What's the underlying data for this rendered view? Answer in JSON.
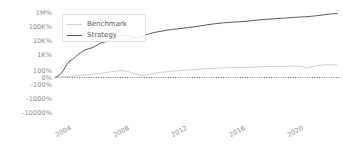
{
  "chart_data": {
    "type": "line",
    "title": "",
    "xlabel": "",
    "ylabel": "",
    "yscale": "symlog-percent",
    "grid": false,
    "legend_position": "upper-left",
    "y_ticks": [
      "1M%",
      "100K%",
      "10K%",
      "1K%",
      "100%",
      "0%",
      "-100%",
      "-1000%",
      "-10000%"
    ],
    "y_tick_values": [
      1000000,
      100000,
      10000,
      1000,
      100,
      0,
      -100,
      -1000,
      -10000
    ],
    "x_ticks": [
      "2004",
      "2008",
      "2012",
      "2016",
      "2020"
    ],
    "x_tick_values": [
      2004,
      2008,
      2012,
      2016,
      2020
    ],
    "xlim": [
      2003.0,
      2022.6
    ],
    "zero_line": "0%",
    "series": [
      {
        "name": "Benchmark",
        "color": "#cfcfcf",
        "x": [
          2003.0,
          2003.3,
          2003.6,
          2004.0,
          2004.4,
          2004.8,
          2005.2,
          2005.6,
          2006.0,
          2006.4,
          2006.8,
          2007.2,
          2007.6,
          2007.9,
          2008.2,
          2008.6,
          2008.9,
          2009.2,
          2009.6,
          2010.0,
          2010.5,
          2011.0,
          2011.5,
          2012.0,
          2012.5,
          2013.0,
          2013.5,
          2014.0,
          2014.5,
          2015.0,
          2015.5,
          2016.0,
          2016.5,
          2017.0,
          2017.5,
          2018.0,
          2018.5,
          2019.0,
          2019.5,
          2020.0,
          2020.3,
          2020.6,
          2021.0,
          2021.5,
          2022.0,
          2022.4
        ],
        "values": [
          0,
          4,
          10,
          18,
          25,
          33,
          42,
          52,
          63,
          74,
          86,
          98,
          106,
          98,
          80,
          52,
          30,
          36,
          55,
          72,
          84,
          96,
          104,
          112,
          120,
          132,
          142,
          150,
          156,
          160,
          162,
          166,
          172,
          180,
          188,
          194,
          190,
          196,
          204,
          196,
          150,
          178,
          212,
          240,
          250,
          232
        ]
      },
      {
        "name": "Strategy",
        "color": "#555a5e",
        "x": [
          2003.0,
          2003.2,
          2003.4,
          2003.6,
          2003.8,
          2004.0,
          2004.2,
          2004.4,
          2004.6,
          2004.8,
          2005.0,
          2005.3,
          2005.6,
          2005.9,
          2006.2,
          2006.5,
          2006.8,
          2007.1,
          2007.4,
          2007.7,
          2008.0,
          2008.3,
          2008.6,
          2008.9,
          2009.2,
          2009.5,
          2009.8,
          2010.1,
          2010.4,
          2010.7,
          2011.0,
          2011.4,
          2011.8,
          2012.2,
          2012.6,
          2013.0,
          2013.4,
          2013.8,
          2014.2,
          2014.6,
          2015.0,
          2015.4,
          2015.8,
          2016.2,
          2016.6,
          2017.0,
          2017.4,
          2017.8,
          2018.2,
          2018.6,
          2019.0,
          2019.4,
          2019.8,
          2020.2,
          2020.6,
          2021.0,
          2021.4,
          2021.8,
          2022.2,
          2022.4
        ],
        "values": [
          0,
          20,
          55,
          120,
          240,
          430,
          520,
          760,
          1100,
          1500,
          2100,
          2800,
          3400,
          5200,
          7600,
          9000,
          13000,
          18000,
          23000,
          26000,
          24000,
          20000,
          17000,
          19000,
          27000,
          33000,
          40000,
          46000,
          52000,
          60000,
          66000,
          73000,
          82000,
          92000,
          105000,
          120000,
          140000,
          160000,
          180000,
          200000,
          215000,
          228000,
          240000,
          260000,
          290000,
          320000,
          350000,
          370000,
          395000,
          420000,
          450000,
          480000,
          510000,
          540000,
          580000,
          640000,
          720000,
          830000,
          900000,
          920000
        ]
      }
    ]
  },
  "legend": {
    "items": [
      {
        "label": "Benchmark",
        "color": "#cfcfcf"
      },
      {
        "label": "Strategy",
        "color": "#555a5e"
      }
    ]
  },
  "axis": {
    "y_labels": [
      "1M%",
      "100K%",
      "10K%",
      "1K%",
      "100%",
      "0%",
      "-100%",
      "-1000%",
      "-10000%"
    ],
    "x_labels": [
      "2004",
      "2008",
      "2012",
      "2016",
      "2020"
    ]
  },
  "colors": {
    "background": "#ffffff",
    "tick_text": "#8a8a8a",
    "legend_text": "#5a5a5a",
    "zero_line": "#6e6e6e",
    "benchmark": "#cfcfcf",
    "strategy": "#555a5e"
  }
}
